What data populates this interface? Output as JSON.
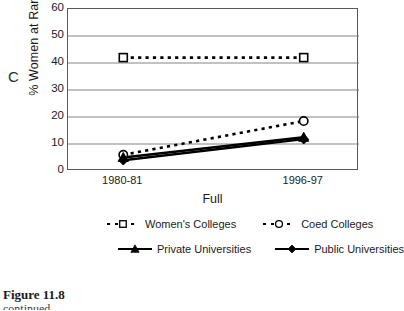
{
  "panel": {
    "letter": "C"
  },
  "caption": {
    "title": "Figure 11.8",
    "subtitle": "continued"
  },
  "chart_data": {
    "type": "line",
    "title": "",
    "xlabel": "Full",
    "ylabel": "% Women at Rank",
    "categories": [
      "1980-81",
      "1996-97"
    ],
    "ylim": [
      0,
      60
    ],
    "yticks": [
      0,
      10,
      20,
      30,
      40,
      50,
      60
    ],
    "grid": true,
    "legend_position": "bottom",
    "series": [
      {
        "name": "Women's Colleges",
        "values": [
          42.0,
          42.0
        ],
        "marker": "open-square",
        "line": "dashed",
        "color": "#000000"
      },
      {
        "name": "Coed Colleges",
        "values": [
          6.0,
          18.5
        ],
        "marker": "open-circle",
        "line": "dashed",
        "color": "#000000"
      },
      {
        "name": "Private Universities",
        "values": [
          5.0,
          12.5
        ],
        "marker": "triangle",
        "line": "solid",
        "color": "#000000"
      },
      {
        "name": "Public Universities",
        "values": [
          4.0,
          11.8
        ],
        "marker": "diamond",
        "line": "solid",
        "color": "#000000"
      }
    ]
  }
}
